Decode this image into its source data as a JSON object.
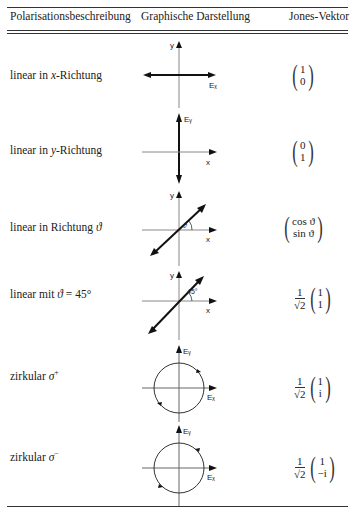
{
  "table": {
    "headers": {
      "description": "Polarisationsbeschreibung",
      "graphic": "Graphische Darstellung",
      "jones": "Jones-Vektor"
    },
    "rows": [
      {
        "description_pre": "linear in ",
        "description_var": "x",
        "description_post": "-Richtung",
        "axis_labels": {
          "y": "y",
          "x": "Eₓ"
        },
        "jones": {
          "prefactor": null,
          "top": "1",
          "bottom": "0"
        }
      },
      {
        "description_pre": "linear in ",
        "description_var": "y",
        "description_post": "-Richtung",
        "axis_labels": {
          "y": "Eᵧ",
          "x": "x"
        },
        "jones": {
          "prefactor": null,
          "top": "0",
          "bottom": "1"
        }
      },
      {
        "description_pre": "linear in Richtung ",
        "description_var": "ϑ",
        "description_post": "",
        "axis_labels": {
          "y": "y",
          "x": "x",
          "angle": "ϑ"
        },
        "jones": {
          "prefactor": null,
          "top": "cos ϑ",
          "bottom": "sin ϑ"
        }
      },
      {
        "description_pre": "linear mit ",
        "description_var": "ϑ",
        "description_post": " = 45°",
        "axis_labels": {
          "y": "y",
          "x": "x",
          "angle": "45°"
        },
        "jones": {
          "prefactor_num": "1",
          "prefactor_den": "√2",
          "top": "1",
          "bottom": "1"
        }
      },
      {
        "description_pre": "zirkular ",
        "description_var": "σ",
        "description_post": "+",
        "axis_labels": {
          "y": "Eᵧ",
          "x": "Eₓ"
        },
        "jones": {
          "prefactor_num": "1",
          "prefactor_den": "√2",
          "top": "1",
          "bottom": "i"
        }
      },
      {
        "description_pre": "zirkular ",
        "description_var": "σ",
        "description_post": "−",
        "axis_labels": {
          "y": "Eᵧ",
          "x": "Eₓ"
        },
        "jones": {
          "prefactor_num": "1",
          "prefactor_den": "√2",
          "top": "1",
          "bottom": "−i"
        }
      }
    ]
  }
}
